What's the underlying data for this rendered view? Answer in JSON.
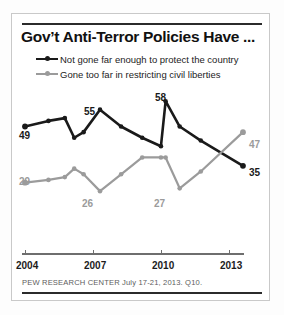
{
  "chart_data": {
    "type": "line",
    "title": "Gov’t Anti-Terror Policies Have ...",
    "xlabel": "",
    "ylabel": "",
    "xlim": [
      2004,
      2013.6
    ],
    "ylim": [
      20,
      62
    ],
    "grid": false,
    "legend_position": "top",
    "xticks": [
      "2004",
      "2007",
      "2010",
      "2013"
    ],
    "xtick_values": [
      2004,
      2007,
      2010,
      2013
    ],
    "series": [
      {
        "name": "Not gone far enough to protect the country",
        "color": "#1a1a1a",
        "x": [
          2004,
          2005,
          2005.7,
          2006.1,
          2006.5,
          2007.2,
          2008.1,
          2009.0,
          2009.8,
          2010.0,
          2010.6,
          2011.5,
          2013.3
        ],
        "values": [
          49,
          51,
          52,
          45,
          47,
          55,
          49,
          45,
          42,
          58,
          49,
          44,
          35
        ],
        "labels": [
          {
            "value": 49,
            "text": "49",
            "position": "left"
          },
          {
            "value": 55,
            "text": "55",
            "position": "above"
          },
          {
            "value": 58,
            "text": "58",
            "position": "above"
          },
          {
            "value": 35,
            "text": "35",
            "position": "right"
          }
        ]
      },
      {
        "name": "Gone too far in restricting civil liberties",
        "color": "#9b9b9b",
        "x": [
          2004,
          2005,
          2005.7,
          2006.1,
          2006.5,
          2007.2,
          2008.1,
          2009.0,
          2009.8,
          2010.0,
          2010.6,
          2011.5,
          2013.3
        ],
        "values": [
          29,
          30,
          31,
          34,
          32,
          26,
          32,
          38,
          38,
          38,
          27,
          33,
          47
        ],
        "labels": [
          {
            "value": 29,
            "text": "29",
            "position": "left"
          },
          {
            "value": 26,
            "text": "26",
            "position": "below"
          },
          {
            "value": 27,
            "text": "27",
            "position": "below"
          },
          {
            "value": 47,
            "text": "47",
            "position": "right"
          }
        ]
      }
    ],
    "source": "PEW RESEARCH CENTER July 17-21, 2013. Q10."
  },
  "legend": {
    "items": [
      {
        "label": "Not gone far enough to protect the country",
        "color": "#1a1a1a"
      },
      {
        "label": "Gone too far in restricting civil liberties",
        "color": "#9b9b9b"
      }
    ]
  },
  "labels": {
    "dark_start": "49",
    "dark_peak_mid": "55",
    "dark_peak_high": "58",
    "dark_end": "35",
    "gray_start": "29",
    "gray_low_1": "26",
    "gray_low_2": "27",
    "gray_end": "47"
  },
  "axis": {
    "ticks": [
      "2004",
      "2007",
      "2010",
      "2013"
    ]
  }
}
